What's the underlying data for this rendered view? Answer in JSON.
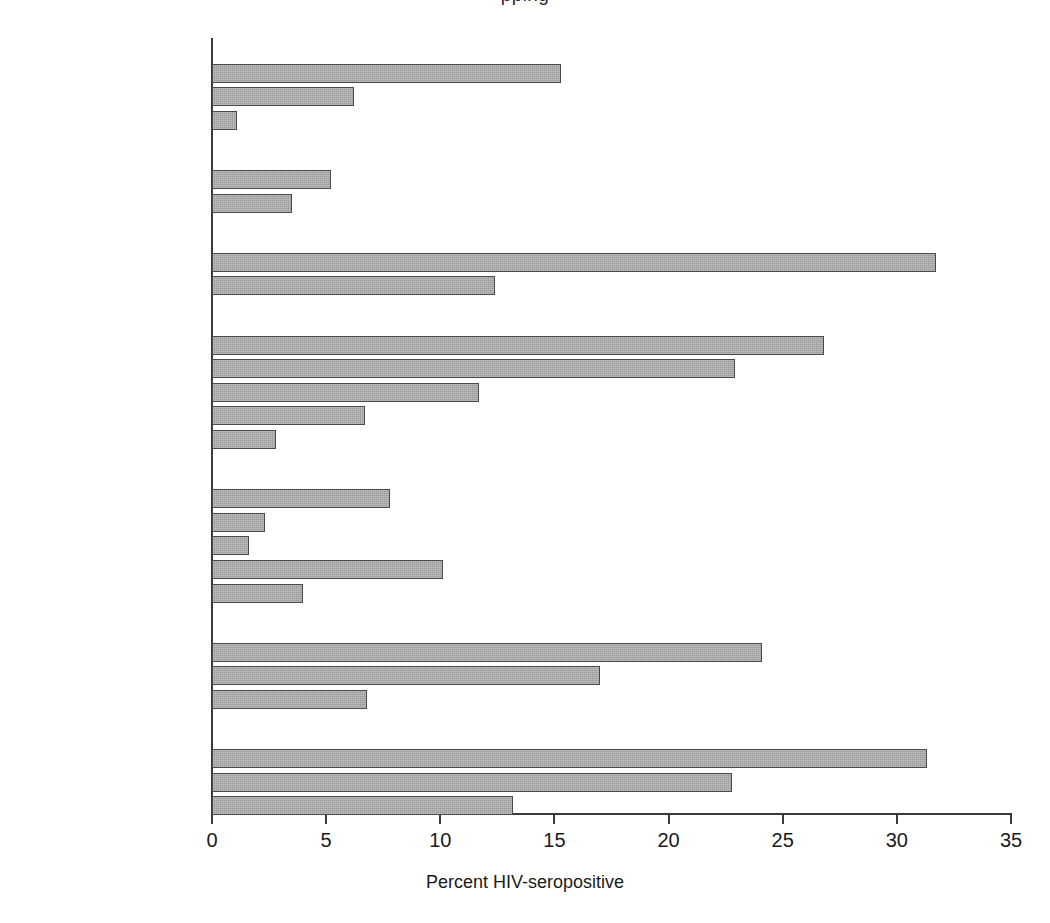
{
  "title_fragment": "pping",
  "chart_data": {
    "type": "bar",
    "orientation": "horizontal",
    "title": "",
    "xlabel": "Percent HIV-seropositive",
    "ylabel": "",
    "xlim": [
      0,
      35
    ],
    "xticks": [
      0,
      5,
      10,
      15,
      20,
      25,
      30,
      35
    ],
    "xtick_labels": [
      "0",
      "5",
      "10",
      "15",
      "20",
      "25",
      "30",
      "35"
    ],
    "grid": false,
    "legend": "none",
    "bar_color": "#9a9a9a",
    "bar_edge_color": "#4a4a4a",
    "groups": [
      {
        "label": "BURUNDI 1991",
        "items": [
          {
            "label": "Bujumbura",
            "value": 15.3
          },
          {
            "label": "Semi-urban",
            "value": 6.2
          },
          {
            "label": "Rural",
            "value": 1.1
          }
        ]
      },
      {
        "label": "COTE D'IVOIRE 1989",
        "items": [
          {
            "label": "Urban",
            "value": 5.2
          },
          {
            "label": "Rural",
            "value": 3.5
          }
        ]
      },
      {
        "label": "MALAWI 1993",
        "items": [
          {
            "label": "Blantyre",
            "value": 31.7
          },
          {
            "label": "Rural",
            "value": 12.4
          }
        ]
      },
      {
        "label": "RWANDA 1989–91",
        "items": [
          {
            "label": "Kilgali",
            "value": 26.8
          },
          {
            "label": "Butare urban",
            "value": 22.9
          },
          {
            "label": "Butare peri-urban",
            "value": 11.7
          },
          {
            "label": "Burate semi-rural",
            "value": 6.7
          },
          {
            "label": "Butare rural",
            "value": 2.8
          }
        ]
      },
      {
        "label": "TANZANIA 1991–2",
        "items": [
          {
            "label": "Arusha urban",
            "value": 7.8
          },
          {
            "label": "Arusha semi-urban",
            "value": 2.3
          },
          {
            "label": "Arusha rural",
            "value": 1.6
          },
          {
            "label": "Mwanza urban",
            "value": 10.1
          },
          {
            "label": "Mwanza rural",
            "value": 4.0
          }
        ]
      },
      {
        "label": "UGANDA 1994",
        "items": [
          {
            "label": "Kabarole urban",
            "value": 24.1
          },
          {
            "label": "Kabarole semi-urban",
            "value": 17.0
          },
          {
            "label": "Kabarole rural",
            "value": 6.8
          }
        ]
      },
      {
        "label": "RAKAI 1992",
        "items": [
          {
            "label": "Trading centers",
            "value": 31.3
          },
          {
            "label": "Trading villages",
            "value": 22.8
          },
          {
            "label": "Rural villages",
            "value": 13.2
          }
        ]
      }
    ]
  }
}
